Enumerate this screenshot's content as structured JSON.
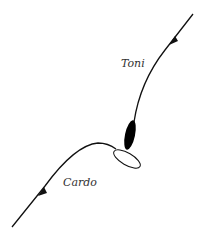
{
  "diagram": {
    "labels": {
      "top": "Toni",
      "bottom": "Cardo"
    },
    "colors": {
      "line": "#111111",
      "background": "#ffffff",
      "fill_dark": "#000000"
    },
    "elements": [
      {
        "name": "Toni path",
        "direction": "downward toward center"
      },
      {
        "name": "Cardo path",
        "direction": "upward toward center"
      },
      {
        "name": "black ellipse",
        "fill": "black"
      },
      {
        "name": "white ellipse",
        "fill": "white"
      }
    ]
  }
}
